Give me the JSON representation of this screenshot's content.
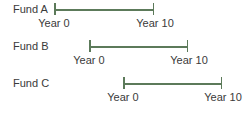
{
  "colors": {
    "line": "#5c7a5a",
    "text": "#3a3a3a"
  },
  "funds": [
    {
      "label": "Fund A",
      "start_label": "Year 0",
      "end_label": "Year 10"
    },
    {
      "label": "Fund B",
      "start_label": "Year 0",
      "end_label": "Year 10"
    },
    {
      "label": "Fund C",
      "start_label": "Year 0",
      "end_label": "Year 10"
    }
  ]
}
